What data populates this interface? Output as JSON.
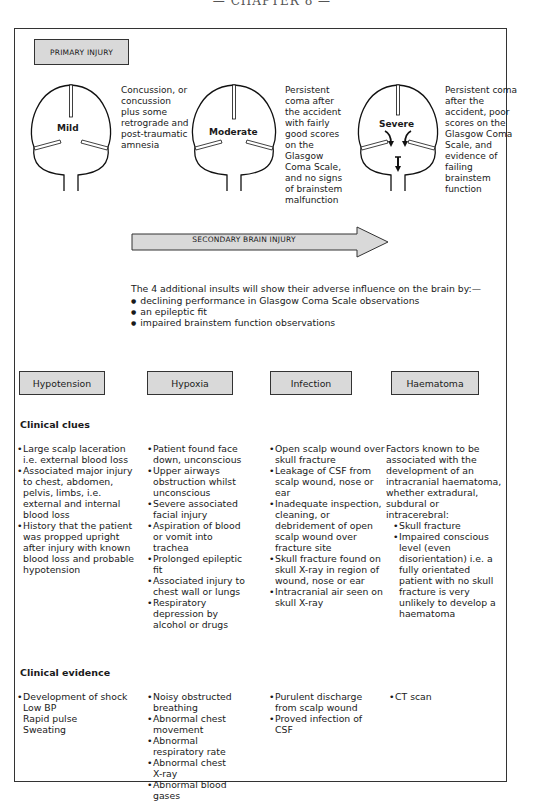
{
  "running_head": "— CHAPTER 8 —",
  "primary_injury": {
    "label": "PRIMARY INJURY",
    "levels": [
      {
        "name": "Mild",
        "description": "Concussion, or concussion plus some retrograde and post-traumatic amnesia"
      },
      {
        "name": "Moderate",
        "description": "Persistent coma after the accident with fairly good scores on the Glasgow Coma Scale, and no signs of brainstem malfunction"
      },
      {
        "name": "Severe",
        "description": "Persistent coma after the accident, poor scores on the Glasgow Coma Scale, and evidence of failing brainstem function"
      }
    ]
  },
  "secondary_injury": {
    "label": "SECONDARY BRAIN INJURY",
    "intro": "The 4 additional insults will show their adverse influence on the brain by:—",
    "bullets": [
      "declining performance in Glasgow Coma Scale observations",
      "an epileptic fit",
      "impaired brainstem function observations"
    ]
  },
  "categories": [
    "Hypotension",
    "Hypoxia",
    "Infection",
    "Haematoma"
  ],
  "clinical_clues": {
    "title": "Clinical clues",
    "hypotension": [
      "Large scalp laceration i.e. external blood loss",
      "Associated major injury to chest, abdomen, pelvis, limbs, i.e. external and internal blood loss",
      "History that the patient was propped upright after injury with known blood loss and probable hypotension"
    ],
    "hypoxia": [
      "Patient found face down, unconscious",
      "Upper airways obstruction whilst unconscious",
      "Severe associated facial injury",
      "Aspiration of blood or vomit into trachea",
      "Prolonged epileptic fit",
      "Associated injury to chest wall or lungs",
      "Respiratory depression by alcohol or drugs"
    ],
    "infection": [
      "Open scalp wound over skull fracture",
      "Leakage of CSF from scalp wound, nose or ear",
      "Inadequate inspection, cleaning, or debridement of open scalp wound over fracture site",
      "Skull fracture found on skull X-ray in region of wound, nose or ear",
      "Intracranial air seen on skull X-ray"
    ],
    "haematoma": {
      "intro": "Factors known to be associated with the development of an intracranial haematoma, whether extradural, subdural or intracerebral:",
      "items": [
        "Skull fracture",
        "Impaired conscious level (even disorientation) i.e. a fully orientated patient with no skull fracture is very unlikely to develop a haematoma"
      ]
    }
  },
  "clinical_evidence": {
    "title": "Clinical evidence",
    "hypotension": {
      "first": "Development of shock",
      "subitems": [
        "Low BP",
        "Rapid pulse",
        "Sweating"
      ]
    },
    "hypoxia": [
      "Noisy obstructed breathing",
      "Abnormal chest movement",
      "Abnormal respiratory rate",
      "Abnormal chest X-ray",
      "Abnormal blood gases"
    ],
    "infection": [
      "Purulent discharge from scalp wound",
      "Proved infection of CSF"
    ],
    "haematoma": [
      "CT scan"
    ]
  }
}
